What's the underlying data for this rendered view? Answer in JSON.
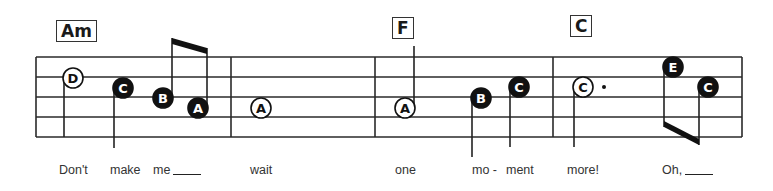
{
  "chords": [
    {
      "label": "Am",
      "x": 56,
      "y": 20
    },
    {
      "label": "F",
      "x": 392,
      "y": 17
    },
    {
      "label": "C",
      "x": 570,
      "y": 15
    }
  ],
  "staff": {
    "left": 36,
    "right": 742,
    "lines_y": [
      57,
      77,
      97,
      117,
      137
    ],
    "barlines_x": [
      36,
      231,
      375,
      553,
      742
    ]
  },
  "notes": [
    {
      "name": "D",
      "x": 73,
      "y": 78,
      "filled": false,
      "stem": "down",
      "stem_to": 137
    },
    {
      "name": "C",
      "x": 123,
      "y": 88,
      "filled": true,
      "stem": "down",
      "stem_to": 148
    },
    {
      "name": "B",
      "x": 163,
      "y": 98,
      "filled": true,
      "stem": "up",
      "stem_to": 38
    },
    {
      "name": "A",
      "x": 198,
      "y": 108,
      "filled": true,
      "stem": "up",
      "stem_to": 48
    },
    {
      "name": "A",
      "x": 261,
      "y": 108,
      "filled": false,
      "stem": "none"
    },
    {
      "name": "A",
      "x": 405,
      "y": 108,
      "filled": false,
      "stem": "up",
      "stem_to": 46
    },
    {
      "name": "B",
      "x": 481,
      "y": 98,
      "filled": true,
      "stem": "down",
      "stem_to": 157
    },
    {
      "name": "C",
      "x": 519,
      "y": 87,
      "filled": true,
      "stem": "down",
      "stem_to": 147
    },
    {
      "name": "C",
      "x": 583,
      "y": 87,
      "filled": false,
      "stem": "down",
      "stem_to": 147,
      "dotted": true
    },
    {
      "name": "E",
      "x": 673,
      "y": 67,
      "filled": true,
      "stem": "down",
      "stem_to": 127
    },
    {
      "name": "C",
      "x": 708,
      "y": 87,
      "filled": true,
      "stem": "down",
      "stem_to": 145
    }
  ],
  "lyrics": [
    {
      "text": "Don't",
      "x": 59,
      "extender": false
    },
    {
      "text": "make",
      "x": 110,
      "extender": false
    },
    {
      "text": "me",
      "x": 153,
      "extender": true
    },
    {
      "text": "wait",
      "x": 250,
      "extender": false
    },
    {
      "text": "one",
      "x": 395,
      "extender": false
    },
    {
      "text": "mo -",
      "x": 472,
      "extender": false
    },
    {
      "text": "ment",
      "x": 506,
      "extender": false
    },
    {
      "text": "more!",
      "x": 567,
      "extender": false
    },
    {
      "text": "Oh,",
      "x": 662,
      "extender": true
    }
  ]
}
